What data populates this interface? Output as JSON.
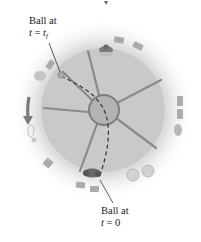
{
  "diagram": {
    "type": "top-view rotating platform (merry-go-round) with ball trajectory",
    "colors": {
      "platform": "#c9c9c9",
      "platform_rim_glow": "#e6e6e6",
      "hub": "#b3b3b3",
      "hub_stroke": "#7d7d7d",
      "spokes": "#8a8a8a",
      "path": "#333333",
      "people": "#9a9a9a",
      "arrow": "#7a7a7a"
    },
    "spoke_count": 6,
    "rotation_arrow": "counterclockwise-arrow (pointing down on left side)",
    "labels": {
      "final": {
        "line1": "Ball at",
        "var": "t",
        "eq": " = ",
        "val_var": "t",
        "val_sub": "f"
      },
      "initial": {
        "line1": "Ball at",
        "var": "t",
        "eq": " = ",
        "val": "0"
      }
    }
  }
}
